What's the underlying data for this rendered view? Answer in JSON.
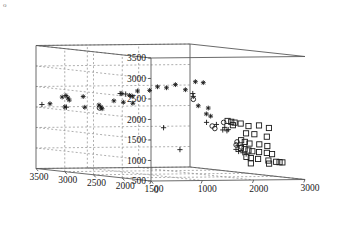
{
  "figure": {
    "corner_mark": "o",
    "background_color": "#ffffff",
    "axis_color": "#595959",
    "grid_color": "#8c8c8c",
    "marker_color": "#1a1a1a"
  },
  "chart_data": {
    "type": "scatter",
    "projection": "3d",
    "title": "",
    "xlabel": "",
    "ylabel": "",
    "zlabel": "",
    "xlim": [
      0,
      3000
    ],
    "ylim": [
      1500,
      3500
    ],
    "zlim": [
      500,
      3500
    ],
    "xticks": [
      0,
      1000,
      2000,
      3000
    ],
    "yticks": [
      1500,
      2000,
      2500,
      3000,
      3500
    ],
    "zticks": [
      500,
      1000,
      1500,
      2000,
      2500,
      3000,
      3500
    ],
    "xticklabels": [
      "0",
      "1000",
      "2000",
      "3000"
    ],
    "yticklabels": [
      "1500",
      "2000",
      "2500",
      "3000",
      "3500"
    ],
    "zticklabels": [
      "500",
      "1000",
      "1500",
      "2000",
      "2500",
      "3000",
      "3500"
    ],
    "grid": true,
    "legend": null,
    "series": [
      {
        "name": "cluster-asterisk",
        "marker": "asterisk",
        "color": "#1a1a1a",
        "points": [
          {
            "x": 250,
            "y": 3480,
            "z": 2080
          },
          {
            "x": 420,
            "y": 3420,
            "z": 2250
          },
          {
            "x": 470,
            "y": 3400,
            "z": 2290
          },
          {
            "x": 505,
            "y": 3395,
            "z": 2230
          },
          {
            "x": 520,
            "y": 3385,
            "z": 2180
          },
          {
            "x": 455,
            "y": 3405,
            "z": 2010
          },
          {
            "x": 740,
            "y": 3340,
            "z": 2270
          },
          {
            "x": 760,
            "y": 3330,
            "z": 2010
          },
          {
            "x": 980,
            "y": 3280,
            "z": 2070
          },
          {
            "x": 1010,
            "y": 3275,
            "z": 2020
          },
          {
            "x": 1030,
            "y": 3270,
            "z": 1980
          },
          {
            "x": 640,
            "y": 2580,
            "z": 2460
          },
          {
            "x": 760,
            "y": 2550,
            "z": 2420
          },
          {
            "x": 800,
            "y": 2540,
            "z": 2400
          },
          {
            "x": 880,
            "y": 2520,
            "z": 2530
          },
          {
            "x": 1060,
            "y": 2470,
            "z": 2550
          },
          {
            "x": 1180,
            "y": 2440,
            "z": 2640
          },
          {
            "x": 1310,
            "y": 2400,
            "z": 2620
          },
          {
            "x": 1450,
            "y": 2370,
            "z": 2700
          },
          {
            "x": 1600,
            "y": 2330,
            "z": 2580
          },
          {
            "x": 1750,
            "y": 2290,
            "z": 2780
          },
          {
            "x": 1870,
            "y": 2260,
            "z": 2760
          },
          {
            "x": 520,
            "y": 2610,
            "z": 2280
          },
          {
            "x": 660,
            "y": 2570,
            "z": 2250
          },
          {
            "x": 800,
            "y": 2530,
            "z": 2230
          },
          {
            "x": 1750,
            "y": 2240,
            "z": 2200
          },
          {
            "x": 1900,
            "y": 2200,
            "z": 2150
          },
          {
            "x": 1840,
            "y": 2180,
            "z": 2010
          },
          {
            "x": 1890,
            "y": 2150,
            "z": 1960
          }
        ]
      },
      {
        "name": "cluster-plus",
        "marker": "plus",
        "color": "#1a1a1a",
        "points": [
          {
            "x": 110,
            "y": 3495,
            "z": 2060
          },
          {
            "x": 480,
            "y": 3400,
            "z": 2005
          },
          {
            "x": 620,
            "y": 2590,
            "z": 2460
          },
          {
            "x": 700,
            "y": 2565,
            "z": 2450
          },
          {
            "x": 1710,
            "y": 2300,
            "z": 2490
          },
          {
            "x": 1720,
            "y": 2300,
            "z": 2420
          },
          {
            "x": 760,
            "y": 1960,
            "z": 1720
          },
          {
            "x": 1530,
            "y": 1900,
            "z": 1850
          },
          {
            "x": 1700,
            "y": 1880,
            "z": 1800
          },
          {
            "x": 1840,
            "y": 1860,
            "z": 1730
          },
          {
            "x": 1790,
            "y": 1850,
            "z": 1670
          },
          {
            "x": 1860,
            "y": 1840,
            "z": 1650
          },
          {
            "x": 1880,
            "y": 1835,
            "z": 1680
          },
          {
            "x": 620,
            "y": 1550,
            "z": 1250
          },
          {
            "x": 1850,
            "y": 1640,
            "z": 1320
          },
          {
            "x": 1790,
            "y": 1620,
            "z": 1230
          },
          {
            "x": 1830,
            "y": 1610,
            "z": 1180
          },
          {
            "x": 1900,
            "y": 1600,
            "z": 1150
          },
          {
            "x": 1960,
            "y": 1595,
            "z": 1120
          }
        ]
      },
      {
        "name": "cluster-circle",
        "marker": "circle",
        "color": "#1a1a1a",
        "points": [
          {
            "x": 990,
            "y": 3280,
            "z": 2000
          },
          {
            "x": 1715,
            "y": 2295,
            "z": 2350
          },
          {
            "x": 1640,
            "y": 1900,
            "z": 1760
          },
          {
            "x": 1680,
            "y": 1890,
            "z": 1700
          },
          {
            "x": 1830,
            "y": 1870,
            "z": 1850
          },
          {
            "x": 1900,
            "y": 1700,
            "z": 1400
          },
          {
            "x": 1860,
            "y": 1680,
            "z": 1330
          },
          {
            "x": 1940,
            "y": 1660,
            "z": 1280
          }
        ]
      },
      {
        "name": "cluster-square",
        "marker": "square",
        "color": "#1a1a1a",
        "points": [
          {
            "x": 1940,
            "y": 1900,
            "z": 1880
          },
          {
            "x": 2000,
            "y": 1890,
            "z": 1860
          },
          {
            "x": 2060,
            "y": 1885,
            "z": 1840
          },
          {
            "x": 2010,
            "y": 1870,
            "z": 1780
          },
          {
            "x": 2150,
            "y": 1860,
            "z": 1820
          },
          {
            "x": 2280,
            "y": 1840,
            "z": 1760
          },
          {
            "x": 2440,
            "y": 1800,
            "z": 1780
          },
          {
            "x": 2600,
            "y": 1770,
            "z": 1720
          },
          {
            "x": 2120,
            "y": 1740,
            "z": 1600
          },
          {
            "x": 2260,
            "y": 1720,
            "z": 1580
          },
          {
            "x": 2480,
            "y": 1700,
            "z": 1520
          },
          {
            "x": 1980,
            "y": 1700,
            "z": 1440
          },
          {
            "x": 2040,
            "y": 1690,
            "z": 1400
          },
          {
            "x": 2120,
            "y": 1680,
            "z": 1360
          },
          {
            "x": 2300,
            "y": 1670,
            "z": 1340
          },
          {
            "x": 2440,
            "y": 1655,
            "z": 1300
          },
          {
            "x": 1920,
            "y": 1650,
            "z": 1260
          },
          {
            "x": 1980,
            "y": 1640,
            "z": 1230
          },
          {
            "x": 2050,
            "y": 1635,
            "z": 1200
          },
          {
            "x": 2120,
            "y": 1630,
            "z": 1180
          },
          {
            "x": 2240,
            "y": 1620,
            "z": 1160
          },
          {
            "x": 2380,
            "y": 1610,
            "z": 1140
          },
          {
            "x": 2470,
            "y": 1600,
            "z": 1110
          },
          {
            "x": 1960,
            "y": 1590,
            "z": 1050
          },
          {
            "x": 2040,
            "y": 1585,
            "z": 1020
          },
          {
            "x": 2170,
            "y": 1575,
            "z": 1000
          },
          {
            "x": 2360,
            "y": 1565,
            "z": 960
          },
          {
            "x": 2500,
            "y": 1555,
            "z": 930
          },
          {
            "x": 2560,
            "y": 1550,
            "z": 920
          },
          {
            "x": 2610,
            "y": 1545,
            "z": 915
          },
          {
            "x": 1990,
            "y": 1540,
            "z": 900
          },
          {
            "x": 2340,
            "y": 1535,
            "z": 890
          }
        ]
      }
    ]
  }
}
